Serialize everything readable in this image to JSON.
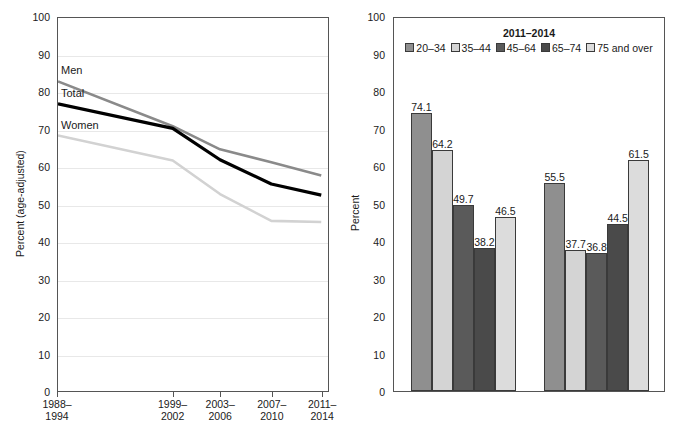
{
  "chart_data": [
    {
      "type": "line",
      "title": "",
      "xlabel": "",
      "ylabel": "Percent (age-adjusted)",
      "ylim": [
        0,
        100
      ],
      "yticks": [
        0,
        10,
        20,
        30,
        40,
        50,
        60,
        70,
        80,
        90,
        100
      ],
      "grid": true,
      "legend_position": "inline-labels",
      "categories": [
        "1988–\n1994",
        "1999–\n2002",
        "2003–\n2006",
        "2007–\n2010",
        "2011–\n2014"
      ],
      "x_positions": [
        0.0,
        0.425,
        0.6,
        0.79,
        0.975
      ],
      "series": [
        {
          "name": "Men",
          "values": [
            83.0,
            71.0,
            64.8,
            61.3,
            57.8
          ],
          "color": "#8a8a8a"
        },
        {
          "name": "Total",
          "values": [
            77.0,
            70.4,
            62.0,
            55.5,
            52.5
          ],
          "color": "#000000"
        },
        {
          "name": "Women",
          "values": [
            68.5,
            61.8,
            52.8,
            45.6,
            45.3
          ],
          "color": "#d2d2d2"
        }
      ]
    },
    {
      "type": "bar",
      "title": "",
      "xlabel": "",
      "ylabel": "Percent",
      "ylim": [
        0,
        100
      ],
      "yticks": [
        0,
        10,
        20,
        30,
        40,
        50,
        60,
        70,
        80,
        90,
        100
      ],
      "grid": false,
      "legend_title": "2011–2014",
      "legend_position": "top-center",
      "categories": [
        "Men",
        "Women"
      ],
      "series": [
        {
          "name": "20–34",
          "values": [
            74.1,
            55.5
          ],
          "color": "#8f8f8f"
        },
        {
          "name": "35–44",
          "values": [
            64.2,
            37.7
          ],
          "color": "#d4d4d4"
        },
        {
          "name": "45–64",
          "values": [
            49.7,
            36.8
          ],
          "color": "#5a5a5a"
        },
        {
          "name": "65–74",
          "values": [
            38.2,
            44.5
          ],
          "color": "#4a4a4a"
        },
        {
          "name": "75 and over",
          "values": [
            46.5,
            61.5
          ],
          "color": "#dcdcdc"
        }
      ]
    }
  ]
}
